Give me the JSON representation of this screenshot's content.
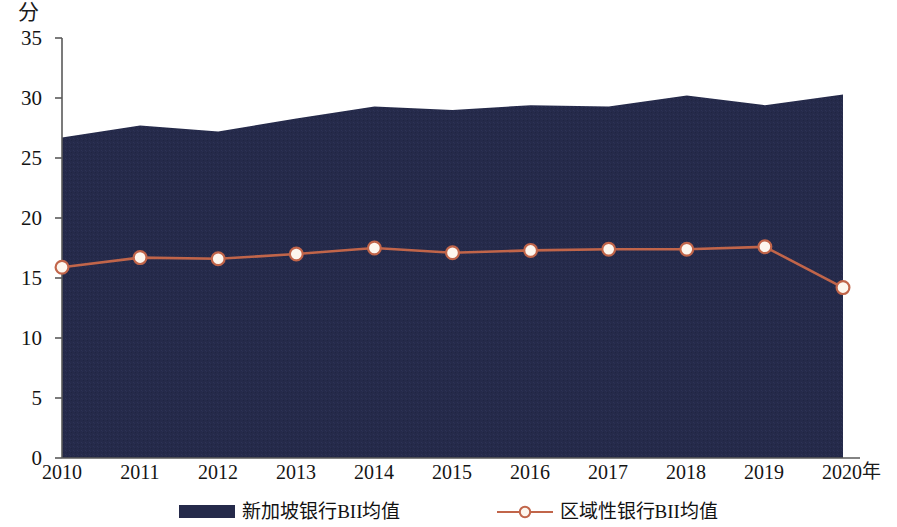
{
  "chart_data": {
    "type": "area",
    "title": "",
    "xlabel": "年",
    "ylabel": "分",
    "ylim": [
      0,
      35
    ],
    "yticks": [
      0,
      5,
      10,
      15,
      20,
      25,
      30,
      35
    ],
    "grid": false,
    "legend_position": "bottom",
    "categories": [
      "2010",
      "2011",
      "2012",
      "2013",
      "2014",
      "2015",
      "2016",
      "2017",
      "2018",
      "2019",
      "2020"
    ],
    "series": [
      {
        "name": "新加坡银行BII均值",
        "type": "area",
        "color": "#252a4a",
        "values": [
          26.7,
          27.7,
          27.2,
          28.3,
          29.3,
          29.0,
          29.4,
          29.3,
          30.2,
          29.4,
          30.3
        ]
      },
      {
        "name": "区域性银行BII均值",
        "type": "line",
        "color": "#c1654a",
        "marker": "circle-open",
        "values": [
          15.9,
          16.7,
          16.6,
          17.0,
          17.5,
          17.1,
          17.3,
          17.4,
          17.4,
          17.6,
          14.2
        ]
      }
    ]
  },
  "axis": {
    "unit_label": "分",
    "x_axis_title": "年",
    "y_tick_labels": [
      "35",
      "30",
      "25",
      "20",
      "15",
      "10",
      "5",
      "0"
    ],
    "x_tick_labels": [
      "2010",
      "2011",
      "2012",
      "2013",
      "2014",
      "2015",
      "2016",
      "2017",
      "2018",
      "2019",
      "2020"
    ]
  },
  "legend": {
    "items": [
      {
        "label": "新加坡银行BII均值",
        "symbol": "filled-area-swatch",
        "color": "#252a4a"
      },
      {
        "label": "区域性银行BII均值",
        "symbol": "line-with-open-circle-marker",
        "color": "#c1654a"
      }
    ]
  },
  "colors": {
    "area_fill": "#252a4a",
    "line": "#c1654a",
    "marker_fill": "#fdf6ee",
    "axis": "#5a5a5a",
    "text": "#141414",
    "background": "#ffffff"
  }
}
